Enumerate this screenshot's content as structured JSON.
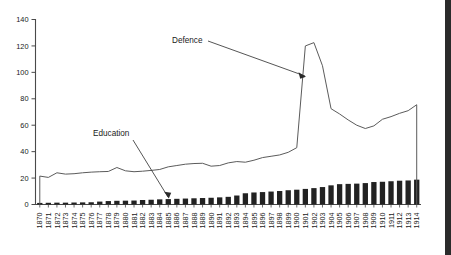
{
  "chart_data": {
    "type": "bar",
    "title": "",
    "subtitle": "",
    "xlabel": "",
    "ylabel": "",
    "ylim": [
      0,
      140
    ],
    "yticks": [
      0,
      20,
      40,
      60,
      80,
      100,
      120,
      140
    ],
    "grid": false,
    "legend_position": "none",
    "annotations": [
      {
        "text": "Defence",
        "target_x": 1899,
        "target_y": 95
      },
      {
        "text": "Education",
        "target_x": 1885,
        "target_y": 4
      }
    ],
    "categories": [
      "1870",
      "1871",
      "1872",
      "1873",
      "1874",
      "1875",
      "1876",
      "1877",
      "1878",
      "1879",
      "1880",
      "1881",
      "1882",
      "1883",
      "1884",
      "1885",
      "1886",
      "1887",
      "1888",
      "1889",
      "1890",
      "1891",
      "1892",
      "1893",
      "1894",
      "1895",
      "1896",
      "1897",
      "1898",
      "1899",
      "1900",
      "1901",
      "1902",
      "1903",
      "1904",
      "1905",
      "1906",
      "1907",
      "1908",
      "1909",
      "1910",
      "1911",
      "1912",
      "1913",
      "1914"
    ],
    "series": [
      {
        "name": "Defence",
        "render": "line",
        "values": [
          21.5,
          20.5,
          24.0,
          23.0,
          23.3,
          24.0,
          24.5,
          24.8,
          25.0,
          28.0,
          25.5,
          24.8,
          25.2,
          25.8,
          26.5,
          28.5,
          29.5,
          30.5,
          31.0,
          31.2,
          29.0,
          29.5,
          31.5,
          32.5,
          32.0,
          33.5,
          35.5,
          36.5,
          37.5,
          39.5,
          43.0,
          120.0,
          122.5,
          105.0,
          72.5,
          68.5,
          64.0,
          60.0,
          57.5,
          59.5,
          64.5,
          66.5,
          69.0,
          71.0,
          75.5
        ]
      },
      {
        "name": "Education",
        "render": "bar",
        "values": [
          1.2,
          1.3,
          1.4,
          1.4,
          1.5,
          1.6,
          1.7,
          2.2,
          2.6,
          2.8,
          2.9,
          3.0,
          3.4,
          3.6,
          3.9,
          4.1,
          4.3,
          4.5,
          4.7,
          4.9,
          5.1,
          5.4,
          5.8,
          6.8,
          8.5,
          9.1,
          9.4,
          9.8,
          10.2,
          10.8,
          11.2,
          11.8,
          12.4,
          13.2,
          14.5,
          15.4,
          15.6,
          15.8,
          16.2,
          17.0,
          17.2,
          17.6,
          18.0,
          18.2,
          18.8
        ]
      }
    ],
    "colors": {
      "line": "#5b5b5b",
      "bar": "#222222",
      "axis": "#4a4a4a",
      "text": "#1a1a1a",
      "background": "#ffffff",
      "right_band": "#2b2b2b"
    }
  }
}
